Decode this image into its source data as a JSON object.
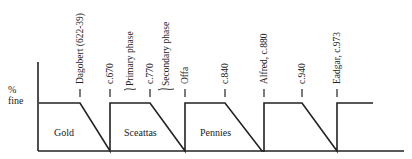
{
  "figure": {
    "y_axis_label_line1": "%",
    "y_axis_label_line2": "fine",
    "regions": [
      {
        "label": "Gold"
      },
      {
        "label": "Sceattas"
      },
      {
        "label": "Pennies"
      }
    ],
    "markers": [
      {
        "label": "Dagobert (622-39)",
        "x": 80
      },
      {
        "label": "c.670",
        "x": 110
      },
      {
        "label": "Primary phase",
        "x": 130
      },
      {
        "label": "c.770",
        "x": 150
      },
      {
        "label": "Secondary phase",
        "x": 166
      },
      {
        "label": "Offa",
        "x": 185
      },
      {
        "label": "c.840",
        "x": 225
      },
      {
        "label": "Alfred, c.880",
        "x": 264
      },
      {
        "label": "c.940",
        "x": 302
      },
      {
        "label": "Eadgar, c.973",
        "x": 337
      }
    ],
    "line_color": "#222222"
  }
}
